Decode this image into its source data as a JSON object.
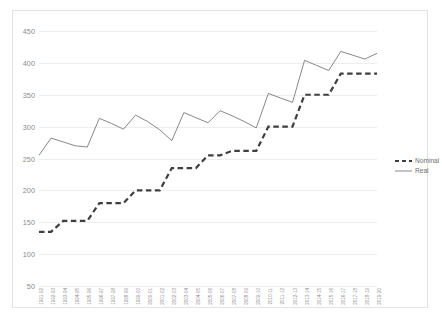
{
  "chart_data": {
    "type": "line",
    "title": "",
    "xlabel": "",
    "ylabel": "",
    "ylim": [
      50,
      450
    ],
    "ytick_step": 50,
    "yticks": [
      450,
      400,
      350,
      300,
      250,
      200,
      150,
      100,
      50
    ],
    "grid": true,
    "legend_position": "right",
    "categories": [
      "1991-92",
      "1992-93",
      "1993-94",
      "1994-95",
      "1995-96",
      "1996-97",
      "1997-98",
      "1998-99",
      "1999-00",
      "2000-01",
      "2001-02",
      "2002-03",
      "2003-04",
      "2004-05",
      "2005-06",
      "2006-07",
      "2007-08",
      "2008-09",
      "2009-10",
      "2010-11",
      "2011-12",
      "2012-13",
      "2013-14",
      "2014-15",
      "2015-16",
      "2016-17",
      "2017-18",
      "2018-19",
      "2019-20"
    ],
    "series": [
      {
        "name": "Nominal",
        "style": "dashed",
        "color": "#3f3f3f",
        "width": 2.2,
        "values": [
          135,
          135,
          152,
          152,
          152,
          180,
          180,
          180,
          200,
          200,
          200,
          235,
          235,
          235,
          255,
          255,
          262,
          262,
          262,
          300,
          300,
          300,
          350,
          350,
          350,
          383,
          383,
          383,
          383
        ]
      },
      {
        "name": "Real",
        "style": "solid",
        "color": "#7a7a7a",
        "width": 0.9,
        "values": [
          255,
          282,
          276,
          270,
          268,
          313,
          305,
          296,
          318,
          308,
          295,
          278,
          322,
          314,
          306,
          325,
          317,
          308,
          298,
          352,
          345,
          338,
          404,
          396,
          388,
          418,
          412,
          406,
          415
        ]
      }
    ],
    "legend": [
      {
        "label": "Nominal",
        "style": "dashed"
      },
      {
        "label": "Real",
        "style": "solid"
      }
    ]
  }
}
